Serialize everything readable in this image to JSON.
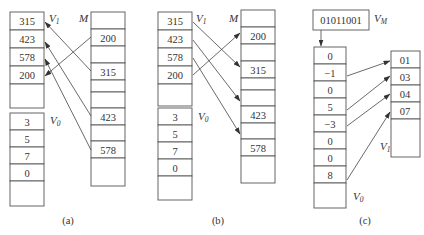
{
  "panels": [
    {
      "caption": "(a)",
      "v1": {
        "label": "V",
        "sub": "1",
        "cells": [
          "315",
          "423",
          "578",
          "200",
          ""
        ]
      },
      "v0": {
        "label": "V",
        "sub": "0",
        "cells": [
          "3",
          "5",
          "7",
          "0",
          ""
        ]
      },
      "m": {
        "label": "M",
        "cells": [
          "",
          "200",
          "",
          "315",
          "",
          "",
          "423",
          "",
          "578",
          ""
        ]
      },
      "arrow_direction": "M to V1 (gather)"
    },
    {
      "caption": "(b)",
      "v1": {
        "label": "V",
        "sub": "1",
        "cells": [
          "315",
          "423",
          "578",
          "200",
          ""
        ]
      },
      "v0": {
        "label": "V",
        "sub": "0",
        "cells": [
          "3",
          "5",
          "7",
          "0",
          ""
        ]
      },
      "m": {
        "label": "M",
        "cells": [
          "",
          "200",
          "",
          "315",
          "",
          "",
          "423",
          "",
          "578",
          ""
        ]
      },
      "arrow_direction": "V1 to M (scatter)"
    },
    {
      "caption": "(c)",
      "vm": {
        "label": "V",
        "sub": "M",
        "value": "01011001"
      },
      "v0": {
        "label": "V",
        "sub": "0",
        "cells": [
          "0",
          "−1",
          "0",
          "5",
          "−3",
          "0",
          "0",
          "8",
          ""
        ]
      },
      "v1": {
        "label": "V",
        "sub": "1",
        "cells": [
          "01",
          "03",
          "04",
          "07",
          ""
        ]
      },
      "arrow_direction": "V0 nonzero to V1 (compress)"
    }
  ]
}
